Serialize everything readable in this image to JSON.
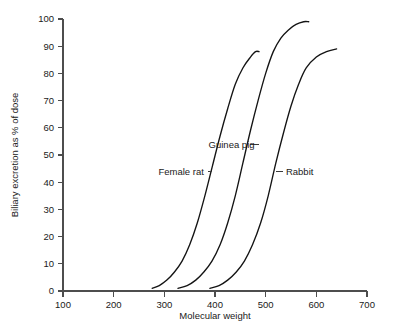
{
  "chart_data": {
    "type": "line",
    "title": "",
    "xlabel": "Molecular weight",
    "ylabel": "Biliary excretion as % of dose",
    "xlim": [
      100,
      700
    ],
    "ylim": [
      0,
      100
    ],
    "xticks": [
      100,
      200,
      300,
      400,
      500,
      600,
      700
    ],
    "yticks": [
      0,
      10,
      20,
      30,
      40,
      50,
      60,
      70,
      80,
      90,
      100
    ],
    "xtick_labels": [
      "100",
      "200",
      "300",
      "400",
      "500",
      "600",
      "700"
    ],
    "ytick_labels": [
      "0",
      "10",
      "20",
      "30",
      "40",
      "50",
      "60",
      "70",
      "80",
      "90",
      "100"
    ],
    "grid": false,
    "legend_position": "inline-annotations",
    "series": [
      {
        "name": "Female rat",
        "label": "Female rat",
        "color": "#141414",
        "x": [
          276,
          290,
          305,
          320,
          335,
          350,
          365,
          380,
          395,
          410,
          425,
          440,
          455,
          470,
          480,
          487
        ],
        "y": [
          1,
          2,
          4,
          7,
          11,
          17,
          25,
          35,
          46,
          57,
          67,
          76,
          82,
          86,
          88,
          88
        ]
      },
      {
        "name": "Guinea pig",
        "label": "Guinea pig",
        "color": "#141414",
        "x": [
          327,
          345,
          362,
          378,
          394,
          410,
          425,
          440,
          455,
          470,
          485,
          500,
          515,
          530,
          545,
          560,
          575,
          585
        ],
        "y": [
          1,
          2,
          4,
          7,
          11,
          17,
          25,
          35,
          47,
          59,
          70,
          80,
          88,
          93,
          96,
          98,
          99,
          99
        ]
      },
      {
        "name": "Rabbit",
        "label": "Rabbit",
        "color": "#141414",
        "x": [
          390,
          408,
          425,
          442,
          458,
          474,
          490,
          505,
          520,
          535,
          550,
          565,
          580,
          600,
          620,
          640
        ],
        "y": [
          1,
          2,
          4,
          7,
          11,
          17,
          25,
          35,
          47,
          58,
          68,
          76,
          82,
          86,
          88,
          89
        ]
      }
    ],
    "annotations": [
      {
        "name": "Guinea pig",
        "text": "Guinea pig",
        "text_x": 480,
        "text_y": 54,
        "leader_to_x": 470,
        "leader_to_y": 54
      },
      {
        "name": "Female rat",
        "text": "Female rat",
        "text_x": 380,
        "text_y": 44,
        "leader_to_x": 395,
        "leader_to_y": 44
      },
      {
        "name": "Rabbit",
        "text": "Rabbit",
        "text_x": 540,
        "text_y": 44,
        "leader_to_x": 520,
        "leader_to_y": 44
      }
    ]
  },
  "axes": {
    "x_title": "Molecular weight",
    "y_title": "Biliary excretion as % of dose"
  },
  "labels": {
    "guinea_pig": "Guinea pig",
    "female_rat": "Female rat",
    "rabbit": "Rabbit"
  }
}
